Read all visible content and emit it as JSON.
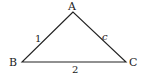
{
  "diagram": {
    "type": "triangle",
    "vertices": {
      "A": {
        "label": "A",
        "x": 73,
        "y": 12
      },
      "B": {
        "label": "B",
        "x": 22,
        "y": 62
      },
      "C": {
        "label": "C",
        "x": 126,
        "y": 62
      }
    },
    "sides": {
      "AB": {
        "label": "1"
      },
      "AC": {
        "label": "c"
      },
      "BC": {
        "label": "2"
      }
    },
    "stroke_color": "#222222"
  }
}
